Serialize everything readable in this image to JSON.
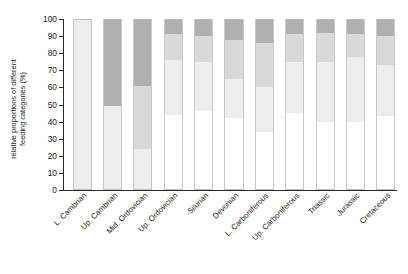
{
  "chart_data": {
    "type": "bar",
    "subtype": "stacked-percentage",
    "title": "",
    "xlabel": "",
    "ylabel": "relative proportions of different feeding categories (%)",
    "ylabel_lines": [
      "relative proportions of different",
      "feeding categories (%)"
    ],
    "ylim": [
      0,
      100
    ],
    "yticks": [
      0,
      10,
      20,
      30,
      40,
      50,
      60,
      70,
      80,
      90,
      100
    ],
    "ytick_labels": [
      "0",
      "10",
      "20",
      "30",
      "40",
      "50",
      "60",
      "70",
      "80",
      "90",
      "100"
    ],
    "grid": false,
    "legend": "none",
    "stack_order_bottom_to_top": [
      "cat1",
      "cat2",
      "cat3",
      "cat4"
    ],
    "colors": {
      "cat1": "#ffffff",
      "cat2": "#ededed",
      "cat3": "#d9d9d9",
      "cat4": "#b0b0b0",
      "axis": "#2b2b2b",
      "text": "#1a1a1a",
      "bar_outline": "#c9c9c9"
    },
    "categories": [
      "L. Cambrian",
      "Up. Cambrian",
      "Mid. Ordovician",
      "Up. Ordovician",
      "Silurian",
      "Devonian",
      "L. Carboniferous",
      "Up. Carboniferous",
      "Triassic",
      "Jurassic",
      "Cretaceous"
    ],
    "series": [
      {
        "name": "cat1",
        "color": "#ffffff",
        "values": [
          0,
          0,
          0,
          44,
          46,
          42,
          34,
          45,
          40,
          40,
          43
        ]
      },
      {
        "name": "cat2",
        "color": "#ededed",
        "values": [
          100,
          49,
          24,
          32,
          29,
          23,
          26,
          30,
          35,
          38,
          30
        ]
      },
      {
        "name": "cat3",
        "color": "#d9d9d9",
        "values": [
          0,
          0,
          37,
          15,
          15,
          23,
          26,
          16,
          17,
          13,
          17
        ]
      },
      {
        "name": "cat4",
        "color": "#b0b0b0",
        "values": [
          0,
          51,
          39,
          9,
          10,
          12,
          14,
          9,
          8,
          9,
          10
        ]
      }
    ],
    "bar_stacks": [
      {
        "category": "L. Cambrian",
        "segments": [
          {
            "series": "cat1",
            "from": 0,
            "to": 0
          },
          {
            "series": "cat2",
            "from": 0,
            "to": 100
          },
          {
            "series": "cat3",
            "from": 100,
            "to": 100
          },
          {
            "series": "cat4",
            "from": 100,
            "to": 100
          }
        ]
      },
      {
        "category": "Up. Cambrian",
        "segments": [
          {
            "series": "cat1",
            "from": 0,
            "to": 0
          },
          {
            "series": "cat2",
            "from": 0,
            "to": 49
          },
          {
            "series": "cat3",
            "from": 49,
            "to": 49
          },
          {
            "series": "cat4",
            "from": 49,
            "to": 100
          }
        ]
      },
      {
        "category": "Mid. Ordovician",
        "segments": [
          {
            "series": "cat1",
            "from": 0,
            "to": 0
          },
          {
            "series": "cat2",
            "from": 0,
            "to": 24
          },
          {
            "series": "cat3",
            "from": 24,
            "to": 61
          },
          {
            "series": "cat4",
            "from": 61,
            "to": 100
          }
        ]
      },
      {
        "category": "Up. Ordovician",
        "segments": [
          {
            "series": "cat1",
            "from": 0,
            "to": 44
          },
          {
            "series": "cat2",
            "from": 44,
            "to": 76
          },
          {
            "series": "cat3",
            "from": 76,
            "to": 91
          },
          {
            "series": "cat4",
            "from": 91,
            "to": 100
          }
        ]
      },
      {
        "category": "Silurian",
        "segments": [
          {
            "series": "cat1",
            "from": 0,
            "to": 46
          },
          {
            "series": "cat2",
            "from": 46,
            "to": 75
          },
          {
            "series": "cat3",
            "from": 75,
            "to": 90
          },
          {
            "series": "cat4",
            "from": 90,
            "to": 100
          }
        ]
      },
      {
        "category": "Devonian",
        "segments": [
          {
            "series": "cat1",
            "from": 0,
            "to": 42
          },
          {
            "series": "cat2",
            "from": 42,
            "to": 65
          },
          {
            "series": "cat3",
            "from": 65,
            "to": 88
          },
          {
            "series": "cat4",
            "from": 88,
            "to": 100
          }
        ]
      },
      {
        "category": "L. Carboniferous",
        "segments": [
          {
            "series": "cat1",
            "from": 0,
            "to": 34
          },
          {
            "series": "cat2",
            "from": 34,
            "to": 60
          },
          {
            "series": "cat3",
            "from": 60,
            "to": 86
          },
          {
            "series": "cat4",
            "from": 86,
            "to": 100
          }
        ]
      },
      {
        "category": "Up. Carboniferous",
        "segments": [
          {
            "series": "cat1",
            "from": 0,
            "to": 45
          },
          {
            "series": "cat2",
            "from": 45,
            "to": 75
          },
          {
            "series": "cat3",
            "from": 75,
            "to": 91
          },
          {
            "series": "cat4",
            "from": 91,
            "to": 100
          }
        ]
      },
      {
        "category": "Triassic",
        "segments": [
          {
            "series": "cat1",
            "from": 0,
            "to": 40
          },
          {
            "series": "cat2",
            "from": 40,
            "to": 75
          },
          {
            "series": "cat3",
            "from": 75,
            "to": 92
          },
          {
            "series": "cat4",
            "from": 92,
            "to": 100
          }
        ]
      },
      {
        "category": "Jurassic",
        "segments": [
          {
            "series": "cat1",
            "from": 0,
            "to": 40
          },
          {
            "series": "cat2",
            "from": 40,
            "to": 78
          },
          {
            "series": "cat3",
            "from": 78,
            "to": 91
          },
          {
            "series": "cat4",
            "from": 91,
            "to": 100
          }
        ]
      },
      {
        "category": "Cretaceous",
        "segments": [
          {
            "series": "cat1",
            "from": 0,
            "to": 43
          },
          {
            "series": "cat2",
            "from": 43,
            "to": 73
          },
          {
            "series": "cat3",
            "from": 73,
            "to": 90
          },
          {
            "series": "cat4",
            "from": 90,
            "to": 100
          }
        ]
      }
    ]
  }
}
